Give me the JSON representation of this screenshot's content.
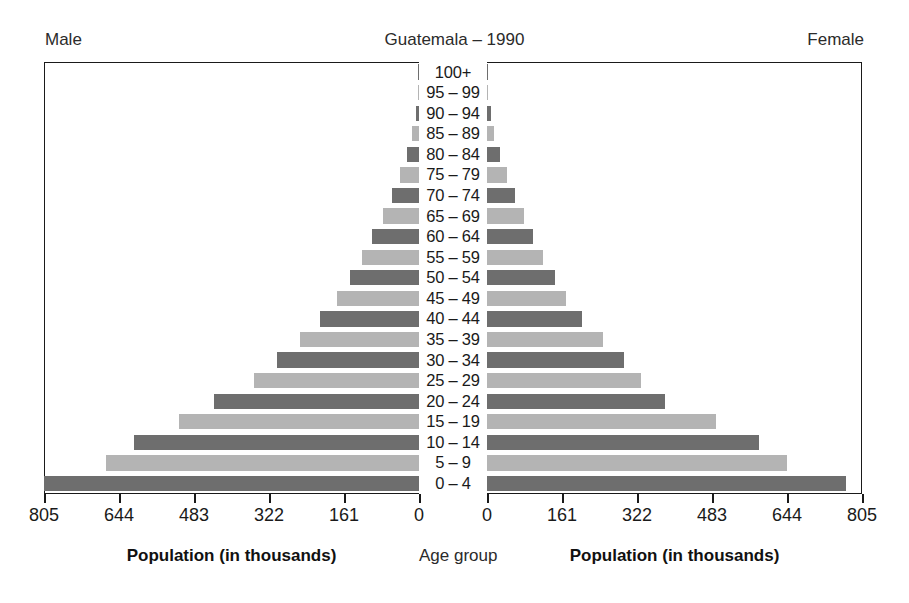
{
  "header": {
    "male_label": "Male",
    "title": "Guatemala – 1990",
    "female_label": "Female"
  },
  "captions": {
    "left": "Population (in thousands)",
    "middle": "Age group",
    "right": "Population (in thousands)"
  },
  "colors": {
    "bar_dark": "#6e6e6e",
    "bar_light": "#b4b4b4",
    "axis": "#1a1a1a",
    "text": "#1a1a1a",
    "background": "#ffffff"
  },
  "chart_data": {
    "type": "bar",
    "subtype": "population-pyramid",
    "title": "Guatemala – 1990",
    "xlabel": "Population (in thousands)",
    "ylabel": "Age group",
    "grid": false,
    "legend": false,
    "xlim": [
      0,
      805
    ],
    "xticks": [
      0,
      161,
      322,
      483,
      644,
      805
    ],
    "left_panel_label": "Male",
    "right_panel_label": "Female",
    "left_xticks": [
      805,
      644,
      483,
      322,
      161,
      0
    ],
    "right_xticks": [
      0,
      161,
      322,
      483,
      644,
      805
    ],
    "categories": [
      "0 – 4",
      "5 – 9",
      "10 – 14",
      "15 – 19",
      "20 – 24",
      "25 – 29",
      "30 – 34",
      "35 – 39",
      "40 – 44",
      "45 – 49",
      "50 – 54",
      "55 – 59",
      "60 – 64",
      "65 – 69",
      "70 – 74",
      "75 – 79",
      "80 – 84",
      "85 – 89",
      "90 – 94",
      "95 – 99",
      "100+"
    ],
    "series": [
      {
        "name": "Male",
        "side": "left",
        "values": [
          805,
          672,
          612,
          515,
          440,
          355,
          305,
          255,
          213,
          175,
          148,
          122,
          100,
          78,
          58,
          40,
          25,
          14,
          7,
          3,
          1
        ]
      },
      {
        "name": "Female",
        "side": "right",
        "values": [
          770,
          645,
          583,
          492,
          382,
          330,
          295,
          250,
          205,
          170,
          145,
          120,
          98,
          80,
          60,
          42,
          27,
          15,
          8,
          3,
          1
        ]
      }
    ]
  }
}
